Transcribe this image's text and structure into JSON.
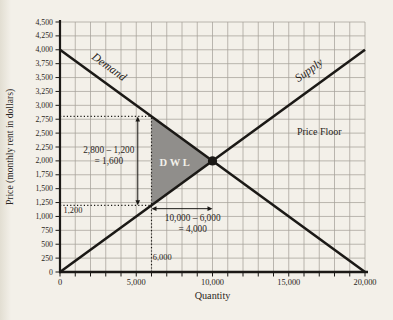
{
  "colors": {
    "background": "#f3f0e9",
    "grid": "#a5a299",
    "line": "#1b1916",
    "dotted": "#1b1916",
    "dwl_fill": "#908e8b",
    "dwl_text": "#f2f0ea",
    "text": "#2a2521"
  },
  "chart_data": {
    "type": "line",
    "title": "",
    "xlabel": "Quantity",
    "ylabel": "Price (monthly rent in dollars)",
    "xlim": [
      0,
      20000
    ],
    "ylim": [
      0,
      4500
    ],
    "grid": true,
    "x_gridline_step": 1000,
    "y_gridline_step": 250,
    "x_tick_step": 1000,
    "y_tick_step": 250,
    "x_label_step": 5000,
    "y_label_step": 250,
    "x_tick_labels": [
      "0",
      "5,000",
      "10,000",
      "15,000",
      "20,000"
    ],
    "y_tick_labels": [
      "0",
      "250",
      "500",
      "750",
      "1,000",
      "1,250",
      "1,500",
      "1,750",
      "2,000",
      "2,250",
      "2,500",
      "2,750",
      "3,000",
      "3,250",
      "3,500",
      "3,750",
      "4,000",
      "4,250",
      "4,500"
    ],
    "series": [
      {
        "name": "Demand",
        "points": [
          [
            0,
            4000
          ],
          [
            20000,
            0
          ]
        ],
        "label": {
          "text": "Demand",
          "q": 3080,
          "p": 3640,
          "angle": 36
        }
      },
      {
        "name": "Supply",
        "points": [
          [
            0,
            0
          ],
          [
            20000,
            4000
          ]
        ],
        "label": {
          "text": "Supply",
          "q": 16460,
          "p": 3580,
          "angle": -36
        }
      }
    ],
    "equilibrium": {
      "q": 10000,
      "p": 2000
    },
    "price_floor": {
      "price": 2800,
      "label": "Price Floor",
      "label_q": 17000,
      "label_p": 2520
    },
    "dwl": {
      "label": "DWL",
      "vertices": [
        [
          6000,
          2800
        ],
        [
          6000,
          1200
        ],
        [
          10000,
          2000
        ]
      ],
      "label_q": 7600,
      "label_p": 1980
    },
    "guides": [
      {
        "type": "h",
        "p": 2800,
        "q0": 0,
        "q1": 6000
      },
      {
        "type": "h",
        "p": 1200,
        "q0": 0,
        "q1": 6000
      },
      {
        "type": "v",
        "q": 6000,
        "p0": 0,
        "p1": 2800
      }
    ],
    "arrows": [
      {
        "type": "v",
        "q": 5100,
        "p0": 1200,
        "p1": 2800
      },
      {
        "type": "h",
        "p": 1140,
        "q0": 6000,
        "q1": 10000
      }
    ],
    "annotations": [
      {
        "cls": "eq-note",
        "lines": [
          "2,800 – 1,200",
          "= 1,600"
        ],
        "q": 3200,
        "p": 2190,
        "anchor": "middle"
      },
      {
        "cls": "eq-note",
        "lines": [
          "10,000 – 6,000",
          "= 4,000"
        ],
        "q": 8700,
        "p": 970,
        "anchor": "middle"
      },
      {
        "cls": "tick-note",
        "lines": [
          "6,000"
        ],
        "q": 6080,
        "p": 270,
        "anchor": "start"
      },
      {
        "cls": "tick-note",
        "lines": [
          "1,200"
        ],
        "q": 850,
        "p": 1120,
        "anchor": "middle"
      }
    ]
  }
}
